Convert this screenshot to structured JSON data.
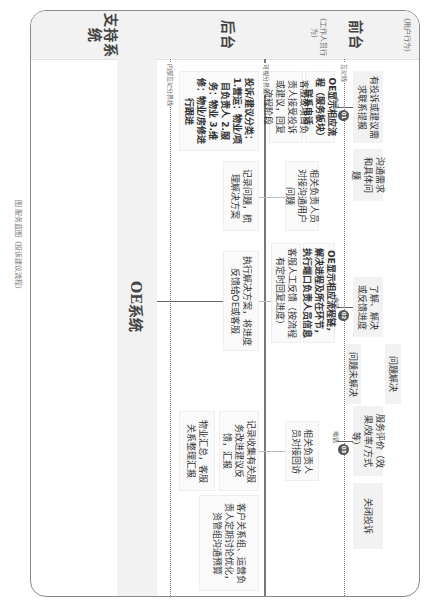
{
  "diagram": {
    "title_caption": "图 服务蓝图（投诉建议流程）",
    "lanes": {
      "customer": {
        "label": "前台",
        "sub": "（用户行为）"
      },
      "frontstage_staff": {
        "label": "前台",
        "sub": "（工作人员行为）"
      },
      "backstage": {
        "label": "后台"
      },
      "support": {
        "label": "支持系统"
      }
    },
    "lines": {
      "interaction": "互动线",
      "visibility": "可视分界线",
      "internal": "内部互动分界线"
    },
    "customer_actions": [
      "有投诉或建议需求联系提报",
      "沟通需求和具体问题",
      "了解、解决或反馈进度",
      "问题未解决",
      "问题解决",
      "服务评价（效果/效率/方式等）",
      "关闭投诉"
    ],
    "frontstage_actions": [
      "OE显示相应流程（服务板块）联系电话",
      "客服或项目负责人接受投诉或建议，回复流程阶段",
      "相关负责人员对接沟通用户问题",
      "OE显示相应流程链，解决进程及所在环节，执行端口负责人员信息",
      "客服人工反馈（按流程有定时回复进度）",
      "相关负责人员对接回访"
    ],
    "backstage_actions": [
      "投诉/建议分类：1.营运：物业/项目负责人 2.服务：物业 3.维修：物业/房修进行跟进",
      "记录问题，梳理解决方案",
      "执行解决方案，将进度反馈给OE或客服",
      "记录收集有关服务改进建议反馈，汇报",
      "物业汇总，客服关系整理汇报",
      "客户关系组、运营负责人定期讨论优化，资管组沟通预算"
    ],
    "support_system": "OE系统",
    "connector_labels": {
      "phone": "电话",
      "badge_1": "01",
      "badge_2": "02",
      "badge_3": "03"
    },
    "colors": {
      "box_fill": "#f2f2f2",
      "line": "#777777",
      "badge": "#555555"
    }
  }
}
